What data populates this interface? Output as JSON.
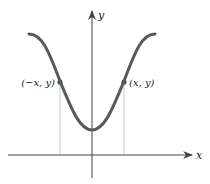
{
  "diagram": {
    "type": "even-function-graph",
    "axes": {
      "x_label": "x",
      "y_label": "y"
    },
    "points": [
      {
        "label": "(−x, y)",
        "side": "left"
      },
      {
        "label": "(x, y)",
        "side": "right"
      }
    ],
    "colors": {
      "curve": "#5a5a5a",
      "axes": "#444444",
      "guide_lines": "#bbbbbb",
      "points": "#555555"
    }
  }
}
